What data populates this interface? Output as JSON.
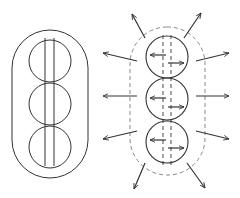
{
  "diagram": {
    "type": "schematic",
    "colors": {
      "stroke": "#333333",
      "dashed": "#888888",
      "background": "#ffffff"
    },
    "left_figure": {
      "capsule": {
        "x": 12,
        "y": 30,
        "w": 76,
        "h": 148,
        "r": 38
      },
      "circles": [
        {
          "cx": 50,
          "cy": 61,
          "r": 21
        },
        {
          "cx": 50,
          "cy": 104,
          "r": 21
        },
        {
          "cx": 50,
          "cy": 147,
          "r": 21
        }
      ],
      "lines": [
        {
          "x": 45,
          "y1": 38,
          "y2": 166
        },
        {
          "x": 54,
          "y1": 38,
          "y2": 166
        }
      ]
    },
    "right_figure": {
      "capsule": {
        "x": 130,
        "y": 27,
        "w": 75,
        "h": 148,
        "r": 37
      },
      "circles": [
        {
          "cx": 167,
          "cy": 57,
          "r": 21
        },
        {
          "cx": 167,
          "cy": 99,
          "r": 21
        },
        {
          "cx": 167,
          "cy": 142,
          "r": 21
        }
      ],
      "dashed_lines": [
        {
          "x": 163,
          "y1": 35,
          "y2": 165
        },
        {
          "x": 171,
          "y1": 35,
          "y2": 165
        }
      ],
      "inner_arrows": [
        {
          "x1": 166,
          "y1": 55,
          "x2": 150,
          "y2": 55
        },
        {
          "x1": 168,
          "y1": 63,
          "x2": 184,
          "y2": 63
        },
        {
          "x1": 166,
          "y1": 98,
          "x2": 150,
          "y2": 98
        },
        {
          "x1": 168,
          "y1": 107,
          "x2": 184,
          "y2": 107
        },
        {
          "x1": 166,
          "y1": 140,
          "x2": 150,
          "y2": 140
        },
        {
          "x1": 168,
          "y1": 148,
          "x2": 184,
          "y2": 148
        }
      ],
      "outer_arrows": [
        {
          "x1": 145,
          "y1": 38,
          "x2": 132,
          "y2": 14
        },
        {
          "x1": 184,
          "y1": 38,
          "x2": 201,
          "y2": 13
        },
        {
          "x1": 137,
          "y1": 61,
          "x2": 103,
          "y2": 53
        },
        {
          "x1": 196,
          "y1": 61,
          "x2": 229,
          "y2": 53
        },
        {
          "x1": 137,
          "y1": 96,
          "x2": 103,
          "y2": 96
        },
        {
          "x1": 196,
          "y1": 96,
          "x2": 229,
          "y2": 96
        },
        {
          "x1": 137,
          "y1": 131,
          "x2": 103,
          "y2": 139
        },
        {
          "x1": 196,
          "y1": 131,
          "x2": 229,
          "y2": 139
        },
        {
          "x1": 145,
          "y1": 163,
          "x2": 134,
          "y2": 189
        },
        {
          "x1": 187,
          "y1": 163,
          "x2": 205,
          "y2": 188
        }
      ]
    }
  }
}
